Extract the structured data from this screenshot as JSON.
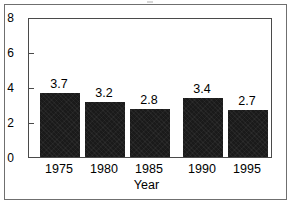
{
  "chart_data": {
    "type": "bar",
    "title": "",
    "subtitle": "",
    "xlabel": "Year",
    "ylabel": "",
    "categories": [
      "1975",
      "1980",
      "1985",
      "1990",
      "1995"
    ],
    "values": [
      3.7,
      3.2,
      2.8,
      3.4,
      2.7
    ],
    "data_labels": [
      "3.7",
      "3.2",
      "2.8",
      "3.4",
      "2.7"
    ],
    "ylim": [
      0,
      8
    ],
    "ytick_labels": [
      "0",
      "2",
      "4",
      "6",
      "8"
    ],
    "ytick_values": [
      0,
      2,
      4,
      6,
      8
    ],
    "grid": false,
    "legend": null,
    "legend_position": "none",
    "bar_color": "#1a1a1a",
    "plot_background": "#ffffff",
    "axis_color": "#4a4a4a",
    "frame_color": "#6f6f6f",
    "annotations": []
  }
}
